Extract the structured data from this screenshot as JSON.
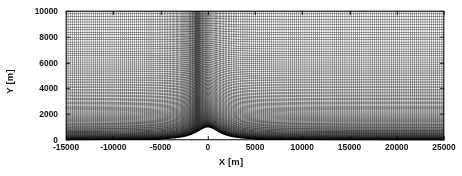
{
  "figure": {
    "title": "",
    "background_color": "#ffffff",
    "line_color": "#000000",
    "text_color": "#111111"
  },
  "axes": {
    "xlabel": "X [m]",
    "ylabel": "Y [m]",
    "x_ticks": [
      "-15000",
      "-10000",
      "-5000",
      "0",
      "5000",
      "10000",
      "15000",
      "20000",
      "25000"
    ],
    "y_ticks": [
      "0",
      "2000",
      "4000",
      "6000",
      "8000",
      "10000"
    ]
  },
  "chart_data": {
    "type": "line",
    "title": "",
    "subtitle": "",
    "xlabel": "X [m]",
    "ylabel": "Y [m]",
    "xlim": [
      -15000,
      25000
    ],
    "ylim": [
      0,
      10000
    ],
    "x_ticks": [
      -15000,
      -10000,
      -5000,
      0,
      5000,
      10000,
      15000,
      20000,
      25000
    ],
    "y_ticks": [
      0,
      2000,
      4000,
      6000,
      8000,
      10000
    ],
    "grid": false,
    "legend": "none",
    "mesh": {
      "n_vertical_lines": 220,
      "n_horizontal_lines": 120,
      "horizontal_refinement_center_x": 0,
      "horizontal_refinement_halfwidth": 4000,
      "horizontal_min_spacing_m": 120,
      "horizontal_max_spacing_m": 900,
      "vertical_stretch_exponent": 2.6,
      "vertical_min_spacing_m": 15,
      "vertical_max_spacing_m": 400
    },
    "terrain": {
      "shape": "witch-of-agnesi",
      "peak_height_m": 1000,
      "peak_x_m": 0,
      "half_width_m": 1500
    },
    "series": [
      {
        "name": "terrain surface",
        "x": [
          -15000,
          -10000,
          -6000,
          -4000,
          -3000,
          -2000,
          -1500,
          -1000,
          -500,
          0,
          500,
          1000,
          1500,
          2000,
          3000,
          4000,
          6000,
          10000,
          25000
        ],
        "values": [
          10,
          22,
          59,
          130,
          220,
          415,
          500,
          692,
          900,
          1000,
          900,
          692,
          500,
          415,
          220,
          130,
          59,
          22,
          4
        ]
      }
    ]
  }
}
